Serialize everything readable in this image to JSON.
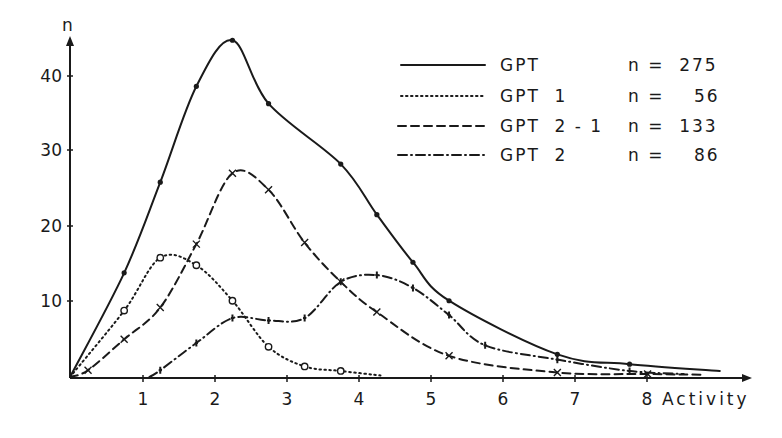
{
  "chart_data": {
    "type": "line",
    "title": "",
    "xlabel": "Activity",
    "ylabel": "n",
    "xlim": [
      0,
      9
    ],
    "ylim": [
      0,
      45
    ],
    "x_ticks": [
      "1",
      "2",
      "3",
      "4",
      "5",
      "6",
      "7",
      "8"
    ],
    "y_ticks": [
      "10",
      "20",
      "30",
      "40"
    ],
    "grid": false,
    "legend_position": "upper right",
    "series": [
      {
        "name": "GPT",
        "n_label": "n = 275",
        "line_style": "solid",
        "marker": "dot",
        "points": [
          [
            0,
            0
          ],
          [
            0.75,
            13.8
          ],
          [
            1.25,
            25.8
          ],
          [
            1.75,
            38.5
          ],
          [
            2.25,
            44.6
          ],
          [
            2.75,
            36.2
          ],
          [
            3.75,
            28.2
          ],
          [
            4.25,
            21.5
          ],
          [
            4.75,
            15.2
          ],
          [
            5.25,
            10.1
          ],
          [
            6.75,
            3.0
          ],
          [
            7.75,
            1.7
          ],
          [
            9.0,
            0.8
          ]
        ]
      },
      {
        "name": "GPT 1",
        "n_label": "n = 56",
        "line_style": "dotted",
        "marker": "circle",
        "points": [
          [
            0,
            0
          ],
          [
            0.75,
            8.8
          ],
          [
            1.25,
            15.8
          ],
          [
            1.75,
            14.8
          ],
          [
            2.25,
            10.1
          ],
          [
            2.75,
            4.0
          ],
          [
            3.25,
            1.4
          ],
          [
            3.75,
            0.8
          ],
          [
            4.3,
            0.2
          ]
        ]
      },
      {
        "name": "GPT 2-1",
        "n_label": "n = 133",
        "line_style": "dashed",
        "marker": "x",
        "points": [
          [
            0,
            0
          ],
          [
            0.25,
            0.9
          ],
          [
            0.75,
            5.0
          ],
          [
            1.25,
            9.2
          ],
          [
            1.75,
            17.6
          ],
          [
            2.25,
            27.0
          ],
          [
            2.75,
            24.8
          ],
          [
            3.25,
            17.8
          ],
          [
            3.75,
            12.6
          ],
          [
            4.25,
            8.6
          ],
          [
            5.25,
            2.8
          ],
          [
            6.75,
            0.6
          ],
          [
            8.0,
            0.4
          ],
          [
            8.75,
            0.3
          ]
        ]
      },
      {
        "name": "GPT 2",
        "n_label": "n = 86",
        "line_style": "dash-dot",
        "marker": "plus",
        "points": [
          [
            1.1,
            0
          ],
          [
            1.25,
            0.9
          ],
          [
            1.75,
            4.5
          ],
          [
            2.25,
            7.8
          ],
          [
            2.75,
            7.5
          ],
          [
            3.25,
            7.8
          ],
          [
            3.75,
            12.6
          ],
          [
            4.25,
            13.5
          ],
          [
            4.75,
            11.8
          ],
          [
            5.25,
            8.2
          ],
          [
            5.75,
            4.2
          ],
          [
            6.75,
            2.3
          ],
          [
            7.75,
            0.8
          ],
          [
            8.5,
            0.4
          ]
        ]
      }
    ]
  },
  "axes": {
    "y_label": "n",
    "x_label": "Activity",
    "x_ticks": [
      "1",
      "2",
      "3",
      "4",
      "5",
      "6",
      "7",
      "8"
    ],
    "y_ticks": [
      "10",
      "20",
      "30",
      "40"
    ]
  },
  "legend": [
    {
      "name": "GPT",
      "n": "n =  275"
    },
    {
      "name": "GPT  1",
      "n": "n =    56"
    },
    {
      "name": "GPT  2 - 1",
      "n": "n =  133"
    },
    {
      "name": "GPT  2",
      "n": "n =    86"
    }
  ]
}
